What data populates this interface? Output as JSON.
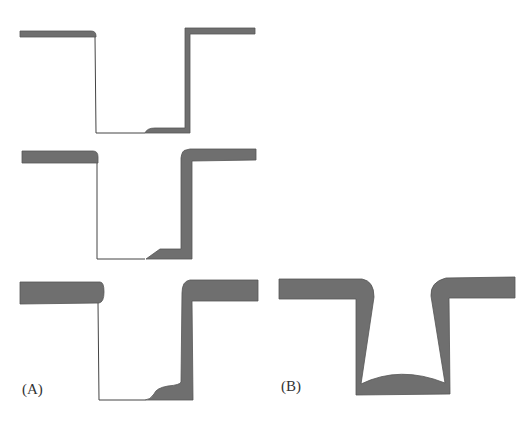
{
  "figure": {
    "panels": [
      {
        "id": "A",
        "label": "(A)",
        "profiles": [
          "thin film, directional deposition",
          "medium thickness film",
          "thick film"
        ]
      },
      {
        "id": "B",
        "label": "(B)",
        "profiles": [
          "conformal film with overhangs and rounded bottom fill"
        ]
      }
    ]
  },
  "colors": {
    "film": "#6f6f6f",
    "outline": "#444444",
    "background": "#ffffff"
  }
}
